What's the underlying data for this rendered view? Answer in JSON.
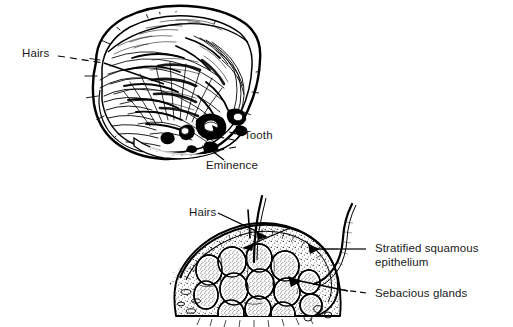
{
  "figure": {
    "background_color": "#ffffff",
    "ink_color": "#000000",
    "text_color": "#1a1a1a",
    "panels": [
      {
        "id": "gross-specimen",
        "description": "Opened dermoid cyst, oval mass densely packed with hair",
        "labels": [
          "Hairs",
          "Tooth",
          "Eminence"
        ]
      },
      {
        "id": "histology-section",
        "description": "Cross-section of dermoid cyst wall with sebaceous glands and hair shafts",
        "labels": [
          "Hairs",
          "Stratified squamous epithelium",
          "Sebacious glands"
        ]
      }
    ]
  },
  "labels": {
    "top_hairs": "Hairs",
    "top_tooth": "Tooth",
    "top_eminence": "Eminence",
    "bottom_hairs": "Hairs",
    "bottom_epithelium_line1": "Stratified squamous",
    "bottom_epithelium_line2": "epithelium",
    "bottom_sebaceous": "Sebacious glands"
  }
}
